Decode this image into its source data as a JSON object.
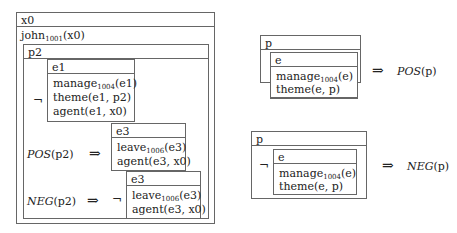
{
  "left_drs": {
    "referent": "x0",
    "condition": {
      "pred": "john",
      "sub": "1001",
      "args": "(x0)"
    },
    "p2_box": {
      "referent": "p2",
      "neg_symbol": "¬",
      "e1_box": {
        "referent": "e1",
        "conditions": [
          {
            "pred": "manage",
            "sub": "1004",
            "args": "(e1)"
          },
          {
            "pred": "theme(e1, p2)",
            "sub": "",
            "args": ""
          },
          {
            "pred": "agent(e1, x0)",
            "sub": "",
            "args": ""
          }
        ]
      },
      "pos_rule": {
        "label": "POS",
        "arg": "(p2)",
        "arrow": "⇒",
        "box": {
          "referent": "e3",
          "conditions": [
            {
              "pred": "leave",
              "sub": "1006",
              "args": "(e3)"
            },
            {
              "pred": "agent(e3, x0)",
              "sub": "",
              "args": ""
            }
          ]
        }
      },
      "neg_rule": {
        "label": "NEG",
        "arg": "(p2)",
        "arrow": "⇒",
        "neg_symbol": "¬",
        "box": {
          "referent": "e3",
          "conditions": [
            {
              "pred": "leave",
              "sub": "1006",
              "args": "(e3)"
            },
            {
              "pred": "agent(e3, x0)",
              "sub": "",
              "args": ""
            }
          ]
        }
      }
    }
  },
  "pos_template": {
    "referent": "p",
    "inner": {
      "referent": "e",
      "conditions": [
        {
          "pred": "manage",
          "sub": "1004",
          "args": "(e)"
        },
        {
          "pred": "theme(e, p)",
          "sub": "",
          "args": ""
        }
      ]
    },
    "arrow": "⇒",
    "result_label": "POS",
    "result_arg": "(p)"
  },
  "neg_template": {
    "referent": "p",
    "neg_symbol": "¬",
    "inner": {
      "referent": "e",
      "conditions": [
        {
          "pred": "manage",
          "sub": "1004",
          "args": "(e)"
        },
        {
          "pred": "theme(e, p)",
          "sub": "",
          "args": ""
        }
      ]
    },
    "arrow": "⇒",
    "result_label": "NEG",
    "result_arg": "(p)"
  }
}
